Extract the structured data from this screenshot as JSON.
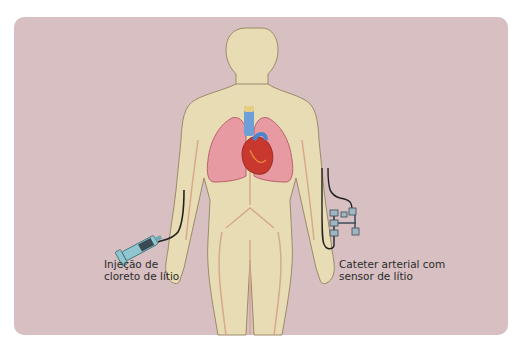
{
  "figure": {
    "background_color": "#d8bfc2",
    "body_color": "#e8dcb4",
    "labels": {
      "injection_line1": "Injeção de",
      "injection_line2": "cloreto de lítio",
      "catheter_line1": "Cateter arterial com",
      "catheter_line2": "sensor de lítio"
    },
    "elements": [
      "human-body-outline",
      "lungs",
      "heart",
      "trachea",
      "syringe",
      "injection-tube",
      "arterial-catheter",
      "lithium-sensor"
    ]
  }
}
